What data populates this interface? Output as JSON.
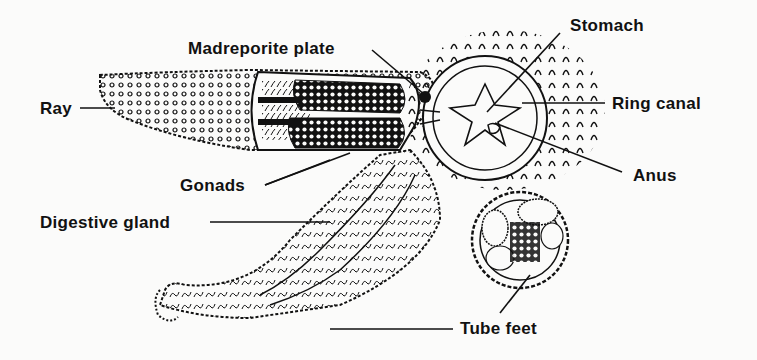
{
  "diagram": {
    "labels": [
      {
        "id": "madreporite",
        "text": "Madreporite plate",
        "x": 188,
        "y": 40
      },
      {
        "id": "stomach",
        "text": "Stomach",
        "x": 570,
        "y": 17
      },
      {
        "id": "ray",
        "text": "Ray",
        "x": 40,
        "y": 100
      },
      {
        "id": "ring-canal",
        "text": "Ring canal",
        "x": 612,
        "y": 95
      },
      {
        "id": "anus",
        "text": "Anus",
        "x": 633,
        "y": 167
      },
      {
        "id": "gonads",
        "text": "Gonads",
        "x": 180,
        "y": 177
      },
      {
        "id": "digestive-gland",
        "text": "Digestive gland",
        "x": 40,
        "y": 214
      },
      {
        "id": "tube-feet",
        "text": "Tube feet",
        "x": 460,
        "y": 320
      }
    ],
    "colors": {
      "ink": "#111111",
      "paper": "#fbfbfa"
    }
  }
}
